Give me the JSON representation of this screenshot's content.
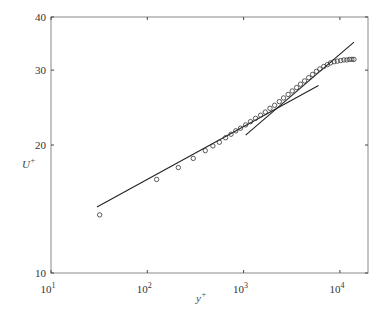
{
  "chart_data": {
    "type": "scatter",
    "title": "",
    "xlabel": "y+",
    "ylabel": "U+",
    "xscale": "log",
    "yscale": "log",
    "xlim": [
      10,
      30000
    ],
    "ylim": [
      10,
      40
    ],
    "grid": false,
    "legend": null,
    "x_ticks": [
      {
        "value": 10,
        "label": "10",
        "exp": "1"
      },
      {
        "value": 100,
        "label": "10",
        "exp": "2"
      },
      {
        "value": 1000,
        "label": "10",
        "exp": "3"
      },
      {
        "value": 10000,
        "label": "10",
        "exp": "4"
      }
    ],
    "y_ticks": [
      {
        "value": 10,
        "label": "10"
      },
      {
        "value": 20,
        "label": "20"
      },
      {
        "value": 30,
        "label": "30"
      },
      {
        "value": 40,
        "label": "40"
      }
    ],
    "series": [
      {
        "name": "measured profile",
        "style": "open-circle",
        "x": [
          32,
          125,
          210,
          300,
          400,
          480,
          560,
          650,
          740,
          830,
          930,
          1050,
          1180,
          1330,
          1500,
          1680,
          1880,
          2100,
          2350,
          2600,
          2900,
          3200,
          3550,
          3900,
          4300,
          4750,
          5200,
          5700,
          6200,
          6800,
          7400,
          8000,
          8700,
          9400,
          10200,
          11000,
          11800,
          12600,
          13300,
          14000
        ],
        "y": [
          13.7,
          16.6,
          17.7,
          18.6,
          19.4,
          19.9,
          20.3,
          20.8,
          21.2,
          21.6,
          21.9,
          22.3,
          22.7,
          23.1,
          23.5,
          23.9,
          24.4,
          24.8,
          25.3,
          25.8,
          26.3,
          26.8,
          27.3,
          27.8,
          28.3,
          28.8,
          29.3,
          29.8,
          30.2,
          30.6,
          30.9,
          31.2,
          31.4,
          31.5,
          31.6,
          31.7,
          31.7,
          31.8,
          31.8,
          31.8
        ]
      },
      {
        "name": "log-law fit",
        "style": "line",
        "x": [
          30,
          6000
        ],
        "y": [
          14.3,
          27.6
        ]
      },
      {
        "name": "steep fit",
        "style": "line",
        "x": [
          1050,
          14000
        ],
        "y": [
          21.1,
          34.9
        ]
      }
    ]
  },
  "colors": {
    "axis": "#8a8a8a",
    "line": "#222222",
    "marker": "#333333",
    "background": "#ffffff"
  }
}
